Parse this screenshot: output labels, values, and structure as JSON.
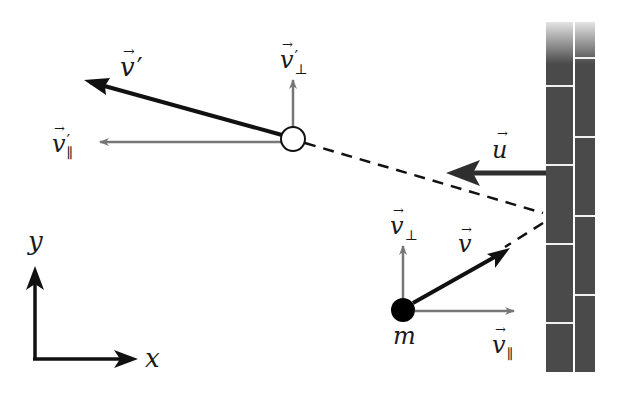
{
  "diagram": {
    "type": "physics-collision-diagram",
    "labels": {
      "v_prime": "v′",
      "v_perp_prime": "v′⊥",
      "v_par_prime": "v′∥",
      "u": "u",
      "v": "v",
      "v_perp": "v⊥",
      "v_par": "v∥",
      "mass": "m",
      "axis_x": "x",
      "axis_y": "y"
    },
    "label_parts": {
      "v_prime_base": "v",
      "v_prime_mark": "′",
      "v_perp_prime_base": "v",
      "v_perp_prime_mark": "′",
      "v_perp_prime_sub": "⊥",
      "v_par_prime_base": "v",
      "v_par_prime_mark": "′",
      "v_par_prime_sub": "∥",
      "u_base": "u",
      "v_base": "v",
      "v_perp_base": "v",
      "v_perp_sub": "⊥",
      "v_par_base": "v",
      "v_par_sub": "∥",
      "arrow_accent": "→"
    },
    "colors": {
      "main_vector": "#111111",
      "component_vector": "#777777",
      "wall_brick": "#4a4a4a",
      "wall_mortar": "#f0f0f0",
      "ball_before": "#000000",
      "ball_after": "#ffffff",
      "u_arrow": "#2e2e2e"
    }
  }
}
